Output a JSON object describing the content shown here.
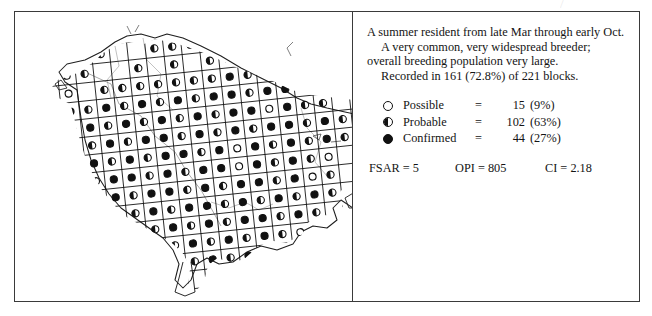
{
  "scan": {
    "top_bleed": "a faint line of text bleeding through from the page above",
    "bottom_bleed": "faint scan artifact"
  },
  "map": {
    "title": "breeding-distribution-map",
    "region_name": "survey region coastline with peninsula",
    "grid": {
      "cell_size_px": 18,
      "rotation_deg": -6,
      "description": "survey block grid overlaid on coastline outline"
    },
    "symbol_legend_ref": [
      "possible",
      "probable",
      "confirmed"
    ]
  },
  "account": {
    "paragraphs": [
      {
        "indent": false,
        "text": "A summer resident from late Mar through early Oct."
      },
      {
        "indent": true,
        "text": "A very common, very widespread breeder; overall breeding population very large."
      },
      {
        "indent": true,
        "text": "Recorded in 161 (72.8%) of 221 blocks."
      }
    ]
  },
  "legend": {
    "rows": [
      {
        "symbol": "open-circle",
        "symbol_class": "possible",
        "label": "Possible",
        "equals": "=",
        "count": "15",
        "percent": "(9%)"
      },
      {
        "symbol": "half-filled-circle",
        "symbol_class": "probable",
        "label": "Probable",
        "equals": "=",
        "count": "102",
        "percent": "(63%)"
      },
      {
        "symbol": "solid-circle",
        "symbol_class": "confirmed",
        "label": "Confirmed",
        "equals": "=",
        "count": "44",
        "percent": "(27%)"
      }
    ]
  },
  "stats": {
    "fsar": "FSAR = 5",
    "opi": "OPI = 805",
    "ci": "CI = 2.18"
  },
  "colors": {
    "ink": "#141414",
    "frame": "#3a3a3a",
    "paper": "#ffffff"
  }
}
